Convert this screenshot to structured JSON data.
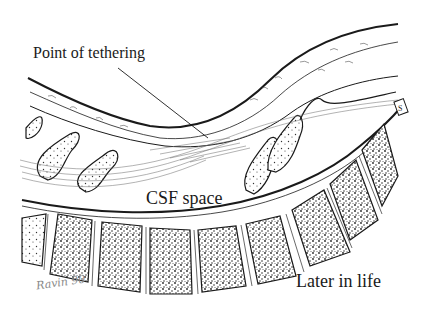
{
  "illustration": {
    "subject": "spinal cord tethering, sagittal section",
    "labels": {
      "tethering": "Point of tethering",
      "csf": "CSF space",
      "stage": "Later in life"
    },
    "vertebra_marker": "S",
    "signature": "Ravin 90"
  },
  "colors": {
    "ink": "#1a1a1a",
    "background": "#ffffff",
    "stipple": "#2a2a2a",
    "hatch": "#555555"
  }
}
